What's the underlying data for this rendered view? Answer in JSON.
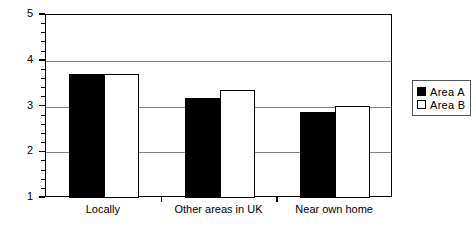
{
  "chart_data": {
    "type": "bar",
    "title": "",
    "xlabel": "",
    "ylabel": "Likert scale score",
    "categories": [
      "Locally",
      "Other areas in UK",
      "Near own home"
    ],
    "series": [
      {
        "name": "Area A",
        "color": "#000000",
        "style": "filled",
        "values": [
          3.72,
          3.18,
          2.89
        ]
      },
      {
        "name": "Area B",
        "color": "#ffffff",
        "style": "hollow",
        "values": [
          3.72,
          3.37,
          3.02
        ]
      }
    ],
    "ylim": [
      1,
      5
    ],
    "ytick_labels": [
      "1",
      "2",
      "3",
      "4",
      "5"
    ],
    "ytick_values": [
      1,
      2,
      3,
      4,
      5
    ],
    "yminor_step": 0.2,
    "grid": "horizontal major gridlines at 2, 3 and 4",
    "legend_position": "right",
    "legend": [
      "Area A",
      "Area B"
    ]
  },
  "axis": {
    "y_label": "Likert scale score",
    "y_ticks": [
      "5",
      "4",
      "3",
      "2",
      "1"
    ],
    "x_labels": [
      "Locally",
      "Other areas in UK",
      "Near own home"
    ]
  },
  "legend": {
    "items": [
      {
        "label": "Area A",
        "swatch": "filled-square-icon"
      },
      {
        "label": "Area B",
        "swatch": "hollow-square-icon"
      }
    ]
  }
}
